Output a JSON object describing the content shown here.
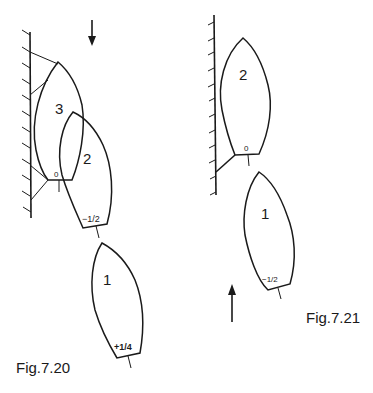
{
  "figures": [
    {
      "caption": "Fig.7.20",
      "direction_arrow": "down",
      "boats": [
        {
          "number": "3",
          "stern_mark": "0"
        },
        {
          "number": "2",
          "stern_mark": "−1/2"
        },
        {
          "number": "1",
          "stern_mark": "+1/4"
        }
      ]
    },
    {
      "caption": "Fig.7.21",
      "direction_arrow": "up",
      "boats": [
        {
          "number": "2",
          "stern_mark": "0"
        },
        {
          "number": "1",
          "stern_mark": "−1/2"
        }
      ]
    }
  ]
}
